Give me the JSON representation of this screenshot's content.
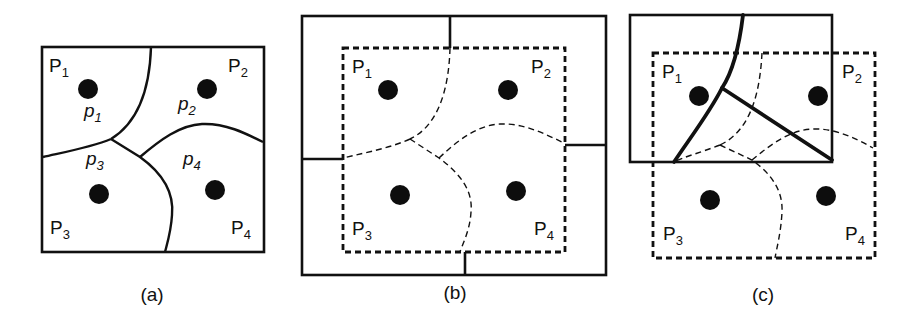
{
  "figure": {
    "panels": [
      {
        "id": "a",
        "caption": "(a)",
        "regions": [
          {
            "label": "P",
            "sub": "1"
          },
          {
            "label": "P",
            "sub": "2"
          },
          {
            "label": "P",
            "sub": "3"
          },
          {
            "label": "P",
            "sub": "4"
          }
        ],
        "cells": [
          {
            "label": "p",
            "sub": "1"
          },
          {
            "label": "p",
            "sub": "2"
          },
          {
            "label": "p",
            "sub": "3"
          },
          {
            "label": "p",
            "sub": "4"
          }
        ]
      },
      {
        "id": "b",
        "caption": "(b)",
        "regions": [
          {
            "label": "P",
            "sub": "1"
          },
          {
            "label": "P",
            "sub": "2"
          },
          {
            "label": "P",
            "sub": "3"
          },
          {
            "label": "P",
            "sub": "4"
          }
        ]
      },
      {
        "id": "c",
        "caption": "(c)",
        "regions": [
          {
            "label": "P",
            "sub": "1"
          },
          {
            "label": "P",
            "sub": "2"
          },
          {
            "label": "P",
            "sub": "3"
          },
          {
            "label": "P",
            "sub": "4"
          }
        ]
      }
    ],
    "colors": {
      "ink": "#111111",
      "background": "#ffffff"
    }
  }
}
